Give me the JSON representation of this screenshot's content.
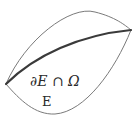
{
  "diagram": {
    "labels": {
      "boundary": "∂E ∩ Ω",
      "set": "E"
    },
    "colors": {
      "outline": "#7a7a7a",
      "boundary_curve": "#3a3a3a",
      "text": "#2a2a2a",
      "background": "#ffffff"
    },
    "curves": {
      "outer_top": "M6,84 C25,40 70,5 95,12 C115,17 125,25 131,30",
      "outer_bottom": "M6,84 C20,100 35,115 55,114 C85,112 115,70 131,30",
      "boundary": "M6,84 C35,55 80,35 131,30"
    }
  }
}
